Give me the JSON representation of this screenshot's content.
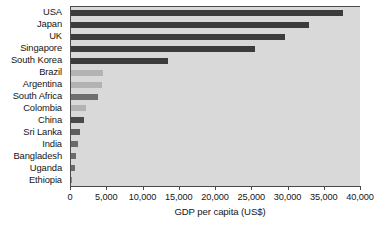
{
  "chart_data": {
    "type": "bar",
    "orientation": "horizontal",
    "title": "",
    "xlabel": "GDP per capita (US$)",
    "ylabel": "",
    "xlim": [
      0,
      40000
    ],
    "xticks": [
      0,
      5000,
      10000,
      15000,
      20000,
      25000,
      30000,
      35000,
      40000
    ],
    "xtick_labels": [
      "0",
      "5,000",
      "10,000",
      "15,000",
      "20,000",
      "25,000",
      "30,000",
      "35,000",
      "40,000"
    ],
    "grid": false,
    "legend": null,
    "categories": [
      "USA",
      "Japan",
      "UK",
      "Singapore",
      "South Korea",
      "Brazil",
      "Argentina",
      "South Africa",
      "Colombia",
      "China",
      "Sri Lanka",
      "India",
      "Bangladesh",
      "Uganda",
      "Ethiopia"
    ],
    "values": [
      37500,
      32800,
      29500,
      25400,
      13400,
      4400,
      4300,
      3700,
      2100,
      1800,
      1300,
      1000,
      700,
      600,
      200
    ],
    "bar_colors": [
      "#3c3c3c",
      "#3c3c3c",
      "#3c3c3c",
      "#3c3c3c",
      "#3c3c3c",
      "#b3b3b3",
      "#b3b3b3",
      "#6f6f6f",
      "#b3b3b3",
      "#4a4a4a",
      "#5e5e5e",
      "#6b6b6b",
      "#6b6b6b",
      "#6b6b6b",
      "#8a8a8a"
    ],
    "plot_background": "#d9d9d9",
    "axis_color": "#4a4a4a",
    "text_color": "#151515"
  }
}
